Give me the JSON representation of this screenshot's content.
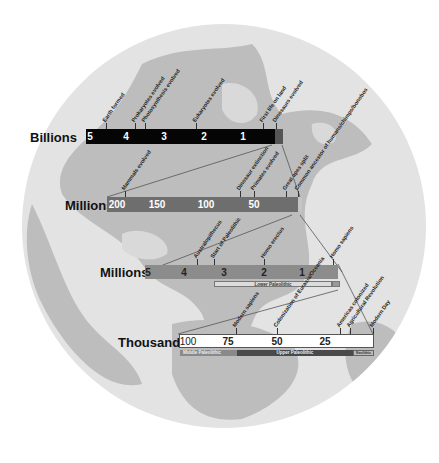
{
  "scales": [
    {
      "id": "billions",
      "label": "Billions",
      "unit": "billion years ago",
      "range": [
        5,
        0
      ],
      "ticks": [
        "5",
        "4",
        "3",
        "2",
        "1"
      ],
      "events": [
        "Earth formed",
        "Prokaryotes evolved",
        "Photosynthesis evolved",
        "Eukaryotes evolved",
        "First life on land",
        "Dinosaurs evolved"
      ]
    },
    {
      "id": "millions-1",
      "label": "Millions",
      "unit": "million years ago",
      "range": [
        200,
        0
      ],
      "ticks": [
        "200",
        "150",
        "100",
        "50"
      ],
      "events": [
        "Mammals evolved",
        "Dinosaur extinction",
        "Primates evolved",
        "Great apes split",
        "Common ancestor of humans/chimps/bonobos"
      ]
    },
    {
      "id": "millions-2",
      "label": "Millions",
      "unit": "million years ago",
      "range": [
        5,
        0
      ],
      "ticks": [
        "5",
        "4",
        "3",
        "2",
        "1"
      ],
      "events": [
        "Australopithecus",
        "Start of Paleolithic",
        "Homo erectus",
        "Homo sapiens"
      ],
      "periods": [
        "Lower Paleolithic",
        ""
      ]
    },
    {
      "id": "thousands",
      "label": "Thousands",
      "unit": "thousand years ago",
      "range": [
        100,
        0
      ],
      "ticks": [
        "100",
        "75",
        "50",
        "25"
      ],
      "events": [
        "Modern sapiens",
        "Colonization of Eurasia/Oceania",
        "Americas colonized",
        "Agricultural Revolution",
        "Modern Day"
      ],
      "periods": [
        "Middle Paleolithic",
        "Upper Paleolithic",
        "Neolithic"
      ]
    }
  ],
  "colors": {
    "billions_bar": "#050505",
    "millions_bar": "#6e6e6e",
    "millions2_bar": "#8c8c8c",
    "thousands_bar": "#ffffff",
    "globe_ocean": "#e3e3e3",
    "globe_land": "#b8b8b8"
  }
}
